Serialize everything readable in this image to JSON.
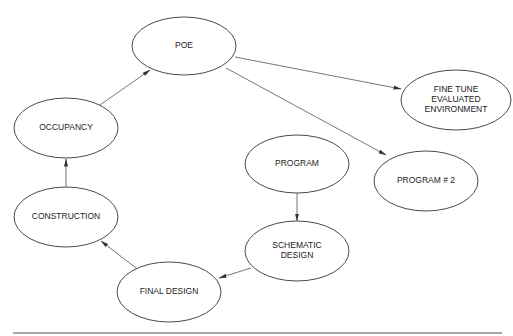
{
  "diagram": {
    "type": "flowchart-cycle",
    "nodes": [
      {
        "id": "poe",
        "label": "POE",
        "lines": [
          "POE"
        ],
        "cx": 184,
        "cy": 46,
        "rx": 52,
        "ry": 29
      },
      {
        "id": "occupancy",
        "label": "OCCUPANCY",
        "lines": [
          "OCCUPANCY"
        ],
        "cx": 66,
        "cy": 128,
        "rx": 52,
        "ry": 30
      },
      {
        "id": "construction",
        "label": "CONSTRUCTION",
        "lines": [
          "CONSTRUCTION"
        ],
        "cx": 66,
        "cy": 217,
        "rx": 52,
        "ry": 30
      },
      {
        "id": "final_design",
        "label": "FINAL DESIGN",
        "lines": [
          "FINAL DESIGN"
        ],
        "cx": 169,
        "cy": 292,
        "rx": 52,
        "ry": 30
      },
      {
        "id": "schematic_design",
        "label": "SCHEMATIC DESIGN",
        "lines": [
          "SCHEMATIC",
          "DESIGN"
        ],
        "cx": 297,
        "cy": 251,
        "rx": 52,
        "ry": 30
      },
      {
        "id": "program",
        "label": "PROGRAM",
        "lines": [
          "PROGRAM"
        ],
        "cx": 297,
        "cy": 164,
        "rx": 52,
        "ry": 29
      },
      {
        "id": "program_2",
        "label": "PROGRAM # 2",
        "lines": [
          "PROGRAM # 2"
        ],
        "cx": 426,
        "cy": 181,
        "rx": 52,
        "ry": 30
      },
      {
        "id": "fine_tune",
        "label": "FINE TUNE EVALUATED ENVIRONMENT",
        "lines": [
          "FINE TUNE",
          "EVALUATED",
          "ENVIRONMENT"
        ],
        "cx": 456,
        "cy": 100,
        "rx": 55,
        "ry": 30
      }
    ],
    "edges": [
      {
        "from": "program",
        "to": "schematic_design",
        "x1": 297,
        "y1": 193,
        "x2": 297,
        "y2": 221
      },
      {
        "from": "schematic_design",
        "to": "final_design",
        "x1": 251,
        "y1": 268,
        "x2": 219,
        "y2": 278
      },
      {
        "from": "final_design",
        "to": "construction",
        "x1": 136,
        "y1": 268,
        "x2": 101,
        "y2": 241
      },
      {
        "from": "construction",
        "to": "occupancy",
        "x1": 66,
        "y1": 187,
        "x2": 66,
        "y2": 159
      },
      {
        "from": "occupancy",
        "to": "poe",
        "x1": 100,
        "y1": 105,
        "x2": 150,
        "y2": 70
      },
      {
        "from": "poe",
        "to": "fine_tune",
        "x1": 235,
        "y1": 57,
        "x2": 401,
        "y2": 89
      },
      {
        "from": "poe",
        "to": "program_2",
        "x1": 226,
        "y1": 68,
        "x2": 386,
        "y2": 155
      }
    ],
    "colors": {
      "background": "#ffffff",
      "node_stroke": "#4a4a4a",
      "edge_stroke": "#666666",
      "text": "#222222",
      "rule": "#8a8a8a"
    },
    "bottom_rule": {
      "x1": 13,
      "x2": 502,
      "y": 333
    }
  }
}
